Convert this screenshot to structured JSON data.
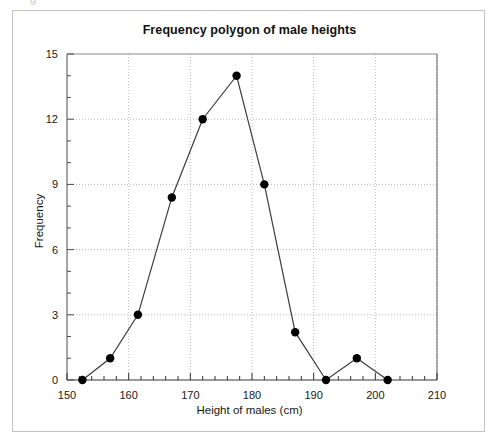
{
  "figure": {
    "cut_glyph": "g",
    "background_color": "#ffffff",
    "frame_color": "#c2c2c2"
  },
  "chart_data": {
    "type": "line",
    "title": "Frequency polygon of male heights",
    "xlabel": "Height of males (cm)",
    "ylabel": "Frequency",
    "xlim": [
      150,
      210
    ],
    "ylim": [
      0,
      15
    ],
    "xticks": [
      150,
      160,
      170,
      180,
      190,
      200,
      210
    ],
    "yticks": [
      0,
      3,
      6,
      9,
      12,
      15
    ],
    "xtick_labels": [
      "150",
      "160",
      "170",
      "180",
      "190",
      "200",
      "210"
    ],
    "ytick_labels": [
      "0",
      "3",
      "6",
      "9",
      "12",
      "15"
    ],
    "x_minor_step": 2,
    "y_minor_step": 1,
    "grid": true,
    "grid_style": "dotted",
    "grid_color": "#b9b9b9",
    "legend": false,
    "marker": "filled-circle",
    "marker_color": "#000000",
    "line_color": "#3c3c3c",
    "x": [
      152.5,
      157,
      161.5,
      167,
      172,
      177.5,
      182,
      187,
      192,
      197,
      202
    ],
    "values": [
      0,
      1,
      3,
      8.4,
      12,
      14,
      9,
      2.2,
      0,
      1,
      0
    ],
    "series": [
      {
        "name": "Frequency of male heights",
        "points": [
          {
            "x": 152.5,
            "y": 0
          },
          {
            "x": 157,
            "y": 1
          },
          {
            "x": 161.5,
            "y": 3
          },
          {
            "x": 167,
            "y": 8.4
          },
          {
            "x": 172,
            "y": 12
          },
          {
            "x": 177.5,
            "y": 14
          },
          {
            "x": 182,
            "y": 9
          },
          {
            "x": 187,
            "y": 2.2
          },
          {
            "x": 192,
            "y": 0
          },
          {
            "x": 197,
            "y": 1
          },
          {
            "x": 202,
            "y": 0
          }
        ]
      }
    ]
  }
}
